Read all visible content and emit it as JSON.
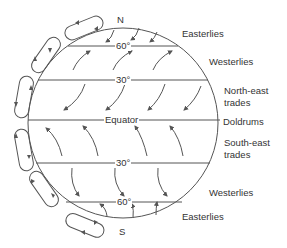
{
  "diagram": {
    "poles": {
      "north": "N",
      "south": "S"
    },
    "latitudes": {
      "n60": "60°",
      "n30": "30°",
      "equator": "Equator",
      "s30": "30°",
      "s60": "60°"
    },
    "wind_belts": [
      {
        "label": "Easterlies"
      },
      {
        "label": "Westerlies"
      },
      {
        "label": "North-east trades"
      },
      {
        "label": "Doldrums"
      },
      {
        "label": "South-east trades"
      },
      {
        "label": "Westerlies"
      },
      {
        "label": "Easterlies"
      }
    ],
    "labels": {
      "easterlies_n": "Easterlies",
      "westerlies_n": "Westerlies",
      "ne_trades_1": "North-east",
      "ne_trades_2": "trades",
      "doldrums": "Doldrums",
      "se_trades_1": "South-east",
      "se_trades_2": "trades",
      "westerlies_s": "Westerlies",
      "easterlies_s": "Easterlies"
    },
    "colors": {
      "line": "#555555",
      "text": "#333333",
      "background": "#ffffff"
    }
  }
}
